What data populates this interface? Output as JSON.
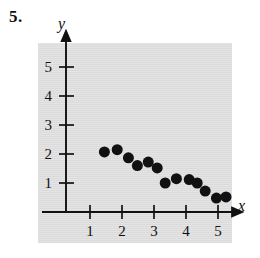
{
  "figure": {
    "problem_number": "5.",
    "background_color": "#ffffff",
    "panel_color": "#e3e3e3",
    "ink_color": "#111111"
  },
  "chart_data": {
    "type": "scatter",
    "title": "",
    "xlabel": "x",
    "ylabel": "y",
    "xlim": [
      0,
      5.8
    ],
    "ylim": [
      0,
      5.6
    ],
    "xticks": [
      1,
      2,
      3,
      4,
      5
    ],
    "yticks": [
      1,
      2,
      3,
      4,
      5
    ],
    "xtick_labels": [
      "1",
      "2",
      "3",
      "4",
      "5"
    ],
    "ytick_labels": [
      "1",
      "2",
      "3",
      "4",
      "5"
    ],
    "grid": false,
    "legend": null,
    "marker": "filled-circle",
    "marker_color": "#111111",
    "marker_size_px": 11,
    "points": [
      {
        "x": 1.45,
        "y": 2.07
      },
      {
        "x": 1.85,
        "y": 2.15
      },
      {
        "x": 2.2,
        "y": 1.87
      },
      {
        "x": 2.48,
        "y": 1.6
      },
      {
        "x": 2.82,
        "y": 1.72
      },
      {
        "x": 3.1,
        "y": 1.52
      },
      {
        "x": 3.35,
        "y": 1.0
      },
      {
        "x": 3.7,
        "y": 1.15
      },
      {
        "x": 4.1,
        "y": 1.12
      },
      {
        "x": 4.35,
        "y": 1.0
      },
      {
        "x": 4.6,
        "y": 0.72
      },
      {
        "x": 4.95,
        "y": 0.48
      },
      {
        "x": 5.25,
        "y": 0.52
      }
    ]
  }
}
